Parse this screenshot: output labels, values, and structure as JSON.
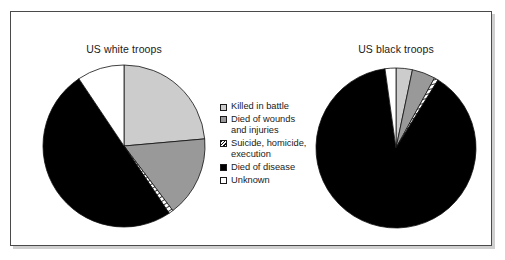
{
  "figure": {
    "frame_border_color": "#4a4a4a",
    "background_color": "#ffffff"
  },
  "legend": {
    "items": [
      {
        "label": "Killed in battle",
        "swatch": "light-gray-square",
        "color": "#cccccc"
      },
      {
        "label": "Died of wounds\nand injuries",
        "swatch": "medium-gray-square",
        "color": "#999999"
      },
      {
        "label": "Suicide, homicide,\nexecution",
        "swatch": "hatched-square",
        "color": "#ffffff"
      },
      {
        "label": "Died of disease",
        "swatch": "black-square",
        "color": "#000000"
      },
      {
        "label": "Unknown",
        "swatch": "white-square",
        "color": "#ffffff"
      }
    ]
  },
  "chart_data": [
    {
      "type": "pie",
      "title": "US white troops",
      "categories": [
        "Killed in battle",
        "Died of wounds and injuries",
        "Suicide, homicide, execution",
        "Died of disease",
        "Unknown"
      ],
      "values": [
        23.6,
        16.1,
        0.9,
        50.0,
        9.4
      ],
      "units": "percent",
      "start_angle_deg": 0,
      "direction": "clockwise",
      "colors": [
        "#cccccc",
        "#999999",
        "#ffffff",
        "#000000",
        "#ffffff"
      ],
      "patterns": [
        "solid",
        "solid",
        "diagonal-hatch",
        "solid",
        "solid"
      ],
      "legend_position": "center"
    },
    {
      "type": "pie",
      "title": "US black troops",
      "categories": [
        "Killed in battle",
        "Died of wounds and injuries",
        "Suicide, homicide, execution",
        "Died of disease",
        "Unknown"
      ],
      "values": [
        3.3,
        4.7,
        0.8,
        89.0,
        2.2
      ],
      "units": "percent",
      "start_angle_deg": 0,
      "direction": "clockwise",
      "colors": [
        "#cccccc",
        "#999999",
        "#ffffff",
        "#000000",
        "#ffffff"
      ],
      "patterns": [
        "solid",
        "solid",
        "diagonal-hatch",
        "solid",
        "solid"
      ],
      "legend_position": "center"
    }
  ]
}
